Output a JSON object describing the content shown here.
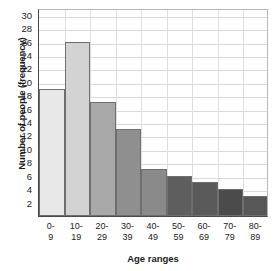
{
  "chart_data": {
    "type": "bar",
    "title": "",
    "xlabel": "Age ranges",
    "ylabel": "Number of people (frequency)",
    "categories": [
      "0-9",
      "10-19",
      "20-29",
      "30-39",
      "40-49",
      "50-59",
      "60-69",
      "70-79",
      "80-89"
    ],
    "category_lines": [
      [
        "0-",
        "9"
      ],
      [
        "10-",
        "19"
      ],
      [
        "20-",
        "29"
      ],
      [
        "30-",
        "39"
      ],
      [
        "40-",
        "49"
      ],
      [
        "50-",
        "59"
      ],
      [
        "60-",
        "69"
      ],
      [
        "70-",
        "79"
      ],
      [
        "80-",
        "89"
      ]
    ],
    "values": [
      19,
      26,
      17,
      13,
      7,
      6,
      5,
      4,
      3
    ],
    "ylim": [
      0,
      31
    ],
    "xlim": [
      0,
      9
    ],
    "ytick_labels": [
      "2",
      "4",
      "6",
      "8",
      "10",
      "12",
      "14",
      "16",
      "18",
      "20",
      "22",
      "24",
      "26",
      "28",
      "30"
    ],
    "ytick_values": [
      2,
      4,
      6,
      8,
      10,
      12,
      14,
      16,
      18,
      20,
      22,
      24,
      26,
      28,
      30
    ],
    "grid": true,
    "grid_color": "#d9d9d9",
    "legend": "none",
    "bar_colors": [
      "#e8e8e8",
      "#d3d3d3",
      "#a8a8a8",
      "#8f8f8f",
      "#8a8a8a",
      "#5e5e5e",
      "#5a5a5a",
      "#4b4b4b",
      "#575757"
    ],
    "bar_border_color": "#6e6e6e",
    "axis_color": "#4a4a4a"
  }
}
